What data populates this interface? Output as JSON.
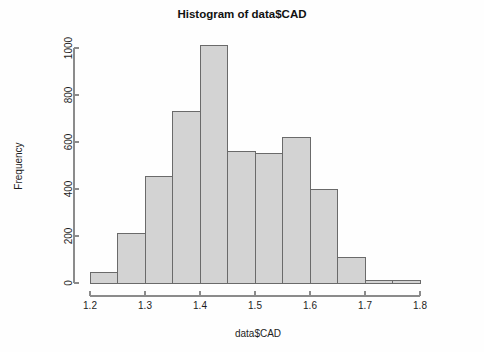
{
  "chart_data": {
    "type": "bar",
    "title": "Histogram of data$CAD",
    "xlabel": "data$CAD",
    "ylabel": "Frequency",
    "bin_width": 0.05,
    "xlim": [
      1.2,
      1.8
    ],
    "ylim": [
      0,
      1000
    ],
    "grid": false,
    "legend": false,
    "bar_fill_color": "#d3d3d3",
    "bar_border_color": "#6a6a6a",
    "axis_color": "#8b8b8b",
    "x_tick_labels": [
      "1.2",
      "1.3",
      "1.4",
      "1.5",
      "1.6",
      "1.7",
      "1.8"
    ],
    "x_tick_values": [
      1.2,
      1.3,
      1.4,
      1.5,
      1.6,
      1.7,
      1.8
    ],
    "y_tick_labels": [
      "0",
      "200",
      "400",
      "600",
      "800",
      "1000"
    ],
    "y_tick_values": [
      0,
      200,
      400,
      600,
      800,
      1000
    ],
    "bin_edges": [
      1.2,
      1.25,
      1.3,
      1.35,
      1.4,
      1.45,
      1.5,
      1.55,
      1.6,
      1.65,
      1.7,
      1.75,
      1.8
    ],
    "categories": [
      "1.20-1.25",
      "1.25-1.30",
      "1.30-1.35",
      "1.35-1.40",
      "1.40-1.45",
      "1.45-1.50",
      "1.50-1.55",
      "1.55-1.60",
      "1.60-1.65",
      "1.65-1.70",
      "1.70-1.75",
      "1.75-1.80"
    ],
    "values": [
      45,
      210,
      452,
      728,
      1010,
      560,
      552,
      618,
      396,
      110,
      12,
      10
    ]
  }
}
